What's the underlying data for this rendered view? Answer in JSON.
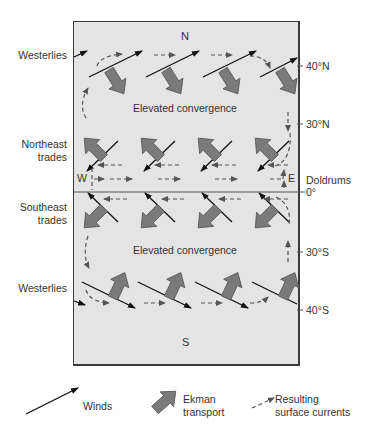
{
  "diagram": {
    "compass": {
      "north": "N",
      "south": "S",
      "west": "W",
      "east": "E"
    },
    "left_labels": {
      "westerlies_north": "Westerlies",
      "northeast_trades_line1": "Northeast",
      "northeast_trades_line2": "trades",
      "southeast_trades_line1": "Southeast",
      "southeast_trades_line2": "trades",
      "westerlies_south": "Westerlies"
    },
    "right_labels": {
      "lat_40n": "40°N",
      "lat_30n": "30°N",
      "doldrums": "Doldrums",
      "equator": "0°",
      "lat_30s": "30°S",
      "lat_40s": "40°S"
    },
    "center_labels": {
      "convergence_north": "Elevated convergence",
      "convergence_south": "Elevated convergence"
    },
    "colors": {
      "ocean_fill": "#e4e4e4",
      "ekman_arrow_fill": "#7a7a7a",
      "ekman_arrow_stroke": "#555555",
      "wind_line": "#111111",
      "current_dash": "#555555",
      "frame": "#3a3a3a"
    }
  },
  "legend": {
    "winds": "Winds",
    "ekman_line1": "Ekman",
    "ekman_line2": "transport",
    "currents_line1": "Resulting",
    "currents_line2": "surface currents"
  }
}
